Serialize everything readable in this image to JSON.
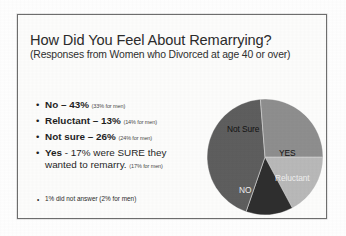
{
  "slide": {
    "title": "How Did You Feel About Remarrying?",
    "subtitle": "(Responses from Women who Divorced at age 40 or over)",
    "bullets": [
      {
        "bullet_char": "•",
        "label": "No",
        "separator": " – ",
        "value": "43%",
        "paren": "(33% for men)",
        "bold": true
      },
      {
        "bullet_char": "•",
        "label": "Reluctant",
        "separator": " – ",
        "value": "13%",
        "paren": "(14% for men)",
        "bold": true
      },
      {
        "bullet_char": "•",
        "label": "Not sure",
        "separator": " – ",
        "value": "26%",
        "paren": "(24% for men)",
        "bold": true
      },
      {
        "bullet_char": "•",
        "label": "Yes",
        "separator": " - ",
        "value": "17% were SURE they wanted to remarry.",
        "paren": "(17% for men)",
        "bold": true
      }
    ],
    "footnote": {
      "bullet_char": "•",
      "text": "1% did not answer (2% for men)"
    }
  },
  "chart_data": {
    "type": "pie",
    "title": "How Did You Feel About Remarrying?",
    "labels": [
      "YES",
      "Reluctant",
      "NO",
      "Not Sure"
    ],
    "values": [
      17,
      13,
      43,
      26
    ],
    "unit": "%",
    "colors": [
      "#b9b9b9",
      "#2e2e2e",
      "#5e5e5e",
      "#8e8e8e"
    ],
    "legend": "none",
    "start_angle_deg": 0,
    "direction": "clockwise",
    "slice_labels_inside": true,
    "women_values": {
      "NO": 43,
      "Reluctant": 13,
      "Not Sure": 26,
      "YES": 17,
      "No answer": 1
    },
    "men_values": {
      "NO": 33,
      "Reluctant": 14,
      "Not Sure": 24,
      "YES": 17,
      "No answer": 2
    }
  }
}
